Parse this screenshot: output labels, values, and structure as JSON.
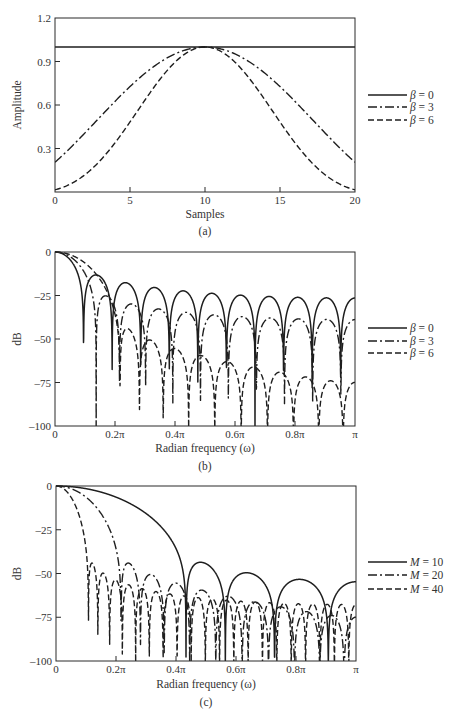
{
  "chart_data": [
    {
      "id": "a",
      "type": "line",
      "caption": "(a)",
      "title": "",
      "xlabel": "Samples",
      "ylabel": "Amplitude",
      "xlim": [
        0,
        20
      ],
      "ylim": [
        0,
        1.2
      ],
      "xticks": [
        0,
        5,
        10,
        15,
        20
      ],
      "xtick_labels": [
        "0",
        "5",
        "10",
        "15",
        "20"
      ],
      "yticks": [
        0.3,
        0.6,
        0.9,
        1.2
      ],
      "ytick_labels": [
        "0.3",
        "0.6",
        "0.9",
        "1.2"
      ],
      "origin_label": "0",
      "grid": false,
      "legend_position": "right",
      "window": "kaiser",
      "M": 20,
      "series": [
        {
          "name": "β = 0",
          "symbol": "β",
          "value_text": "= 0",
          "beta": 0,
          "style": "solid",
          "x": [
            0,
            2,
            4,
            6,
            8,
            10,
            12,
            14,
            16,
            18,
            20
          ],
          "values": [
            1.0,
            1.0,
            1.0,
            1.0,
            1.0,
            1.0,
            1.0,
            1.0,
            1.0,
            1.0,
            1.0
          ]
        },
        {
          "name": "β = 3",
          "symbol": "β",
          "value_text": "= 3",
          "beta": 3,
          "style": "dashdot",
          "x": [
            0,
            2,
            4,
            6,
            8,
            10,
            12,
            14,
            16,
            18,
            20
          ],
          "values": [
            0.205,
            0.41,
            0.62,
            0.8,
            0.95,
            1.0,
            0.95,
            0.8,
            0.62,
            0.41,
            0.205
          ]
        },
        {
          "name": "β = 6",
          "symbol": "β",
          "value_text": "= 6",
          "beta": 6,
          "style": "dashed",
          "x": [
            0,
            2,
            4,
            6,
            8,
            10,
            12,
            14,
            16,
            18,
            20
          ],
          "values": [
            0.015,
            0.1,
            0.29,
            0.57,
            0.88,
            1.0,
            0.88,
            0.57,
            0.29,
            0.1,
            0.015
          ]
        }
      ]
    },
    {
      "id": "b",
      "type": "line",
      "caption": "(b)",
      "title": "",
      "xlabel": "Radian frequency (ω)",
      "ylabel": "dB",
      "xlim": [
        0,
        1
      ],
      "xunit": "π",
      "ylim": [
        -100,
        0
      ],
      "xticks": [
        0,
        0.2,
        0.4,
        0.6,
        0.8,
        1.0
      ],
      "xtick_labels": [
        "0",
        "0.2π",
        "0.4π",
        "0.6π",
        "0.8π",
        "π"
      ],
      "yticks": [
        0,
        -25,
        -50,
        -75,
        -100
      ],
      "ytick_labels": [
        "0",
        "–25",
        "–50",
        "–75",
        "–100"
      ],
      "grid": false,
      "legend_position": "right",
      "window": "kaiser",
      "M": 20,
      "series": [
        {
          "name": "β = 0",
          "symbol": "β",
          "value_text": "= 0",
          "beta": 0,
          "M": 20,
          "style": "solid",
          "first_null": 0.095,
          "peak_sidelobe_db": -13
        },
        {
          "name": "β = 3",
          "symbol": "β",
          "value_text": "= 3",
          "beta": 3,
          "M": 20,
          "style": "dashdot",
          "first_null": 0.14,
          "peak_sidelobe_db": -25
        },
        {
          "name": "β = 6",
          "symbol": "β",
          "value_text": "= 6",
          "beta": 6,
          "M": 20,
          "style": "dashed",
          "first_null": 0.22,
          "peak_sidelobe_db": -44
        }
      ]
    },
    {
      "id": "c",
      "type": "line",
      "caption": "(c)",
      "title": "",
      "xlabel": "Radian frequency (ω)",
      "ylabel": "dB",
      "xlim": [
        0,
        1
      ],
      "xunit": "π",
      "ylim": [
        -100,
        0
      ],
      "xticks": [
        0,
        0.2,
        0.4,
        0.6,
        0.8,
        1.0
      ],
      "xtick_labels": [
        "0",
        "0.2π",
        "0.4π",
        "0.6π",
        "0.8π",
        "π"
      ],
      "yticks": [
        0,
        -25,
        -50,
        -75,
        -100
      ],
      "ytick_labels": [
        "0",
        "–25",
        "–50",
        "–75",
        "–100"
      ],
      "grid": false,
      "legend_position": "right",
      "window": "kaiser",
      "beta": 6,
      "series": [
        {
          "name": "M = 10",
          "symbol": "M",
          "value_text": "= 10",
          "beta": 6,
          "M": 10,
          "style": "solid",
          "first_null": 0.44,
          "peak_sidelobe_db": -43
        },
        {
          "name": "M = 20",
          "symbol": "M",
          "value_text": "= 20",
          "beta": 6,
          "M": 20,
          "style": "dashdot",
          "first_null": 0.22,
          "peak_sidelobe_db": -43
        },
        {
          "name": "M = 40",
          "symbol": "M",
          "value_text": "= 40",
          "beta": 6,
          "M": 40,
          "style": "dashed",
          "first_null": 0.11,
          "peak_sidelobe_db": -43
        }
      ]
    }
  ],
  "colors": {
    "line": "#1e1e1e",
    "axis": "#2a2a2a",
    "text": "#333333",
    "background": "#ffffff"
  }
}
